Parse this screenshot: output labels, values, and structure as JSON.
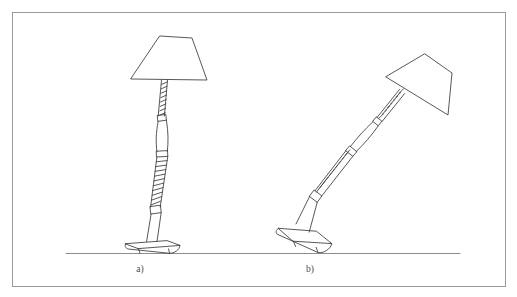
{
  "figure": {
    "background_color": "#ffffff",
    "border": {
      "present": true,
      "color": "#9a9a9a",
      "x": 12,
      "y": 12,
      "width": 493,
      "height": 274,
      "stroke_width": 1
    },
    "ground_line": {
      "color": "#8e8e8e",
      "x1": 66,
      "y1": 253,
      "x2": 460,
      "y2": 253
    },
    "line_color": "#3a3a3a",
    "panels": [
      {
        "id": "panel-a",
        "label": "a)",
        "label_x": 140,
        "label_y": 272,
        "description": "Upright table lamp standing vertically on its base",
        "lamp": {
          "orientation": "upright",
          "tilt_degrees": 7,
          "shade": {
            "shape": "trapezoid",
            "points": "160,36 192,38 207,80 131,79"
          },
          "stem": {
            "segments": [
              {
                "type": "twisted-rope",
                "name": "upper-rope"
              },
              {
                "type": "collar",
                "name": "upper-collar"
              },
              {
                "type": "smooth-spindle",
                "name": "mid-spindle"
              },
              {
                "type": "collar",
                "name": "mid-collar"
              },
              {
                "type": "twisted-rope",
                "name": "lower-rope"
              },
              {
                "type": "collar",
                "name": "lower-collar"
              },
              {
                "type": "smooth-shaft",
                "name": "lower-shaft"
              }
            ]
          },
          "base": {
            "shape": "flat-elliptical-plate",
            "center_x": 152,
            "center_y": 246
          }
        }
      },
      {
        "id": "panel-b",
        "label": "b)",
        "label_x": 310,
        "label_y": 272,
        "description": "Same table lamp tipped over, leaning at an angle with base lifted off the ground on one side",
        "lamp": {
          "orientation": "tilted",
          "tilt_degrees": 38,
          "shade": {
            "shape": "trapezoid",
            "points": "425,54 452,73 448,115 386,77"
          },
          "stem": {
            "segments": [
              {
                "type": "twisted-rope",
                "name": "upper-rope"
              },
              {
                "type": "collar",
                "name": "upper-collar"
              },
              {
                "type": "smooth-spindle",
                "name": "mid-spindle"
              },
              {
                "type": "collar",
                "name": "mid-collar"
              },
              {
                "type": "twisted-rope",
                "name": "lower-rope"
              },
              {
                "type": "collar",
                "name": "lower-collar"
              },
              {
                "type": "smooth-shaft",
                "name": "lower-shaft"
              }
            ]
          },
          "base": {
            "shape": "flat-elliptical-plate-tilted",
            "center_x": 320,
            "center_y": 240
          }
        }
      }
    ]
  }
}
